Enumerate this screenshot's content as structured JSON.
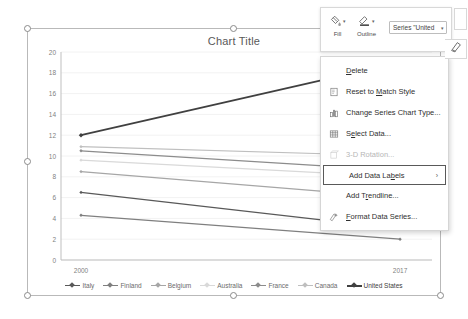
{
  "chart_data": {
    "type": "line",
    "title": "Chart Title",
    "xlabel": "",
    "ylabel": "",
    "categories": [
      "2000",
      "2017"
    ],
    "x_tick_labels": [
      "2000",
      "2017"
    ],
    "y_tick_labels": [
      "0",
      "2",
      "4",
      "6",
      "8",
      "10",
      "12",
      "14",
      "16",
      "18",
      "20"
    ],
    "ylim": [
      0,
      20
    ],
    "y_tick_step": 2,
    "grid": true,
    "legend_position": "bottom",
    "series": [
      {
        "name": "Italy",
        "values": [
          6.5,
          3.0
        ],
        "color": "#595959"
      },
      {
        "name": "Finland",
        "values": [
          4.3,
          2.0
        ],
        "color": "#7f7f7f"
      },
      {
        "name": "Belgium",
        "values": [
          8.5,
          6.0
        ],
        "color": "#a6a6a6"
      },
      {
        "name": "Australia",
        "values": [
          9.6,
          8.0
        ],
        "color": "#d9d9d9"
      },
      {
        "name": "France",
        "values": [
          10.5,
          8.6
        ],
        "color": "#8c8c8c"
      },
      {
        "name": "Canada",
        "values": [
          10.9,
          10.0
        ],
        "color": "#bfbfbf"
      },
      {
        "name": "United States",
        "values": [
          12.0,
          19.0
        ],
        "color": "#404040"
      }
    ]
  },
  "chart": {
    "title": "Chart Title",
    "selected": true
  },
  "mini_toolbar": {
    "fill_label": "Fill",
    "outline_label": "Outline",
    "fill_icon": "fill-bucket-icon",
    "outline_icon": "outline-pen-icon",
    "series_select_value": "Series \"United",
    "brush_icon": "chart-styles-brush-icon"
  },
  "context_menu": {
    "items": [
      {
        "label": "Delete",
        "icon": "none",
        "state": "normal",
        "submenu": false,
        "accel": "D"
      },
      {
        "label": "Reset to Match Style",
        "icon": "reset-style-icon",
        "state": "normal",
        "submenu": false,
        "accel": "M"
      },
      {
        "label": "Change Series Chart Type...",
        "icon": "bar-chart-icon",
        "state": "normal",
        "submenu": false,
        "accel": ""
      },
      {
        "label": "Select Data...",
        "icon": "select-data-icon",
        "state": "normal",
        "submenu": false,
        "accel": "e"
      },
      {
        "label": "3-D Rotation...",
        "icon": "cube-3d-icon",
        "state": "disabled",
        "submenu": false,
        "accel": ""
      },
      {
        "label": "Add Data Labels",
        "icon": "none",
        "state": "highlight",
        "submenu": true,
        "accel": "b"
      },
      {
        "label": "Add Trendline...",
        "icon": "none",
        "state": "normal",
        "submenu": false,
        "accel": "r"
      },
      {
        "label": "Format Data Series...",
        "icon": "format-series-icon",
        "state": "normal",
        "submenu": false,
        "accel": "F"
      }
    ]
  },
  "colors": {
    "axis": "#bfbfbf",
    "grid": "#f2f2f2",
    "text": "#7f7f7f",
    "selection": "#8a8a8a",
    "highlight_border": "#595959"
  }
}
